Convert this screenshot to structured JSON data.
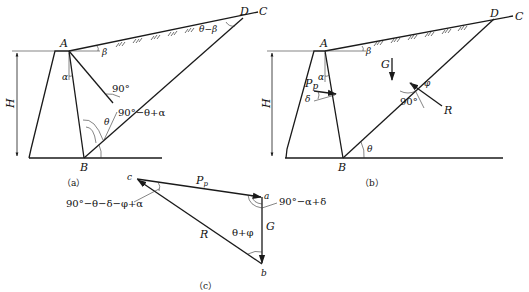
{
  "figure": {
    "panels": [
      {
        "id": "a",
        "caption": "（a）",
        "points": {
          "A": "A",
          "B": "B",
          "C": "C",
          "D": "D"
        },
        "labels": {
          "height": "H",
          "alpha": "α",
          "beta": "β",
          "theta": "θ",
          "right_angle": "90°",
          "angle_B": "90°−θ+α",
          "angle_D": "θ−β"
        }
      },
      {
        "id": "b",
        "caption": "（b）",
        "points": {
          "A": "A",
          "B": "B",
          "C": "C",
          "D": "D"
        },
        "labels": {
          "height": "H",
          "alpha": "α",
          "beta": "β",
          "theta": "θ",
          "phi": "φ",
          "right_angle": "90°",
          "weight": "G",
          "passive_force": "P",
          "passive_force_sub": "p",
          "delta": "δ",
          "reaction": "R"
        }
      },
      {
        "id": "c",
        "caption": "（c）",
        "points": {
          "a": "a",
          "b": "b",
          "c": "c"
        },
        "labels": {
          "side_ca": "P",
          "side_ca_sub": "p",
          "side_ab": "G",
          "side_bc": "R",
          "angle_c": "90°−θ−δ−φ+α",
          "angle_a": "90°−α+δ",
          "angle_b": "θ+φ"
        }
      }
    ]
  }
}
